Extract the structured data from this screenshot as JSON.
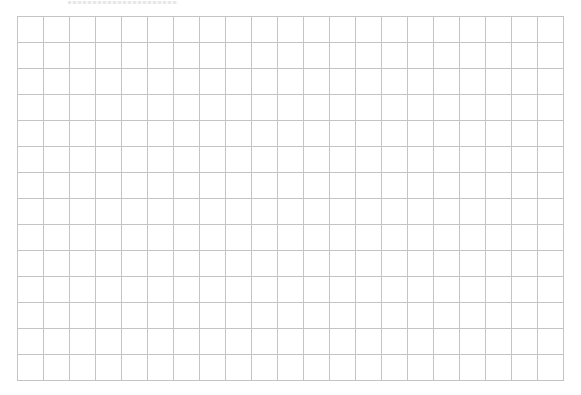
{
  "caption": {
    "text": "",
    "legible": false,
    "note_visible": "clipped text at top edge, illegible"
  },
  "grid": {
    "left": 17,
    "top": 16,
    "columns": 21,
    "rows": 14,
    "cell_size": 26,
    "line_color": "#c4c4c4",
    "background": "#ffffff"
  }
}
